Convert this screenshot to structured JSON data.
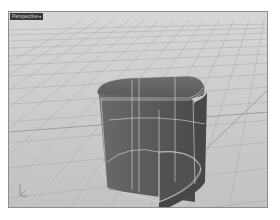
{
  "viewport": {
    "label": "Perspective",
    "label_arrow": "▾",
    "background": "#c9c9c9",
    "grid_color": "#a9a9a9",
    "object_color": "#5b5b5b",
    "edge_color": "#d9d9d9"
  }
}
